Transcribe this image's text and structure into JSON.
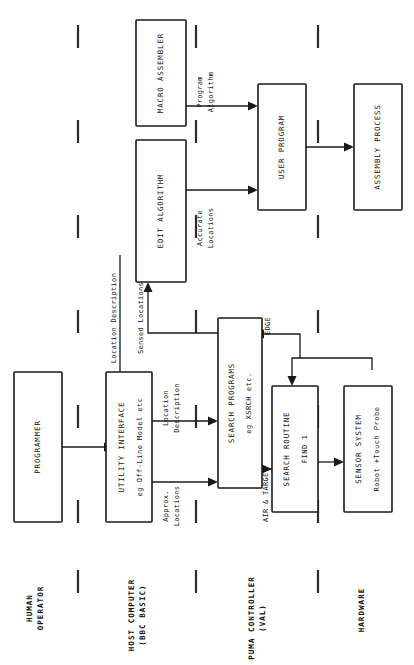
{
  "diagram": {
    "orientation": "rotated-90-ccw",
    "colors": {
      "ink": "#1a1a1a",
      "paper": "#ffffff"
    },
    "swimlanes": [
      {
        "id": "human",
        "label_line1": "HUMAN",
        "label_line2": "OPERATOR"
      },
      {
        "id": "host",
        "label_line1": "HOST COMPUTER",
        "label_line2": "(BBC BASIC)"
      },
      {
        "id": "puma",
        "label_line1": "PUMA CONTROLLER",
        "label_line2": "(VAL)"
      },
      {
        "id": "hardware",
        "label_line1": "HARDWARE",
        "label_line2": ""
      }
    ],
    "boxes": [
      {
        "id": "programmer",
        "line1": "PROGRAMMER",
        "line2": ""
      },
      {
        "id": "utility",
        "line1": "UTILITY INTERFACE",
        "line2": "eg Off-Line Model etc"
      },
      {
        "id": "edit",
        "line1": "EDIT ALGORITHM",
        "line2": ""
      },
      {
        "id": "macro",
        "line1": "MACRO ASSEMBLER",
        "line2": ""
      },
      {
        "id": "user",
        "line1": "USER  PROGRAM",
        "line2": ""
      },
      {
        "id": "assembly",
        "line1": "ASSEMBLY PROCESS",
        "line2": ""
      },
      {
        "id": "searchprog",
        "line1": "SEARCH PROGRAMS",
        "line2": "eg XSRCH etc."
      },
      {
        "id": "searchroutine",
        "line1": "SEARCH ROUTINE",
        "line2": "FIND  1"
      },
      {
        "id": "sensor",
        "line1": "SENSOR SYSTEM",
        "line2": "Robot +Touch Probe"
      }
    ],
    "edge_labels": [
      {
        "id": "location-description-long",
        "line1": "Location Description",
        "line2": ""
      },
      {
        "id": "location-description",
        "line1": "Location",
        "line2": "Description"
      },
      {
        "id": "approx-locations",
        "line1": "Approx.",
        "line2": "Locations"
      },
      {
        "id": "sensed-locations",
        "line1": "Sensed Locations",
        "line2": ""
      },
      {
        "id": "accurate-locations",
        "line1": "Accurate",
        "line2": "Locations"
      },
      {
        "id": "program-algorithm",
        "line1": "Program",
        "line2": "Algorithm"
      },
      {
        "id": "edge",
        "line1": "EDGE",
        "line2": ""
      },
      {
        "id": "air-target",
        "line1": "AIR & TARGET",
        "line2": ""
      }
    ]
  }
}
